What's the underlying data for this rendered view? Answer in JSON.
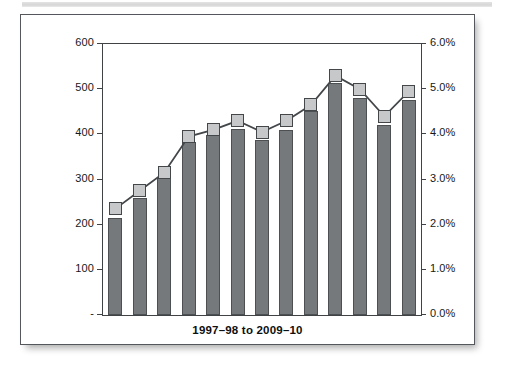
{
  "figure": {
    "frame_border_color": "#54585c",
    "background": "#ffffff"
  },
  "axes": {
    "left": {
      "ticks": [
        "600",
        "500",
        "400",
        "300",
        "200",
        "100",
        "-"
      ],
      "min": 0,
      "max": 600
    },
    "right": {
      "ticks": [
        "6.0%",
        "5.0%",
        "4.0%",
        "3.0%",
        "2.0%",
        "1.0%",
        "0.0%"
      ],
      "min": 0,
      "max": 6
    },
    "x_title": "1997–98 to 2009–10"
  },
  "chart_data": {
    "type": "bar",
    "title": "",
    "subtitle": "",
    "xlabel": "1997–98 to 2009–10",
    "ylabel": "",
    "y2label": "",
    "grid": false,
    "legend": "none",
    "categories": [
      "1997–98",
      "1998–99",
      "1999–00",
      "2000–01",
      "2001–02",
      "2002–03",
      "2003–04",
      "2004–05",
      "2005–06",
      "2006–07",
      "2007–08",
      "2008–09",
      "2009–10"
    ],
    "ylim": [
      0,
      600
    ],
    "y2lim": [
      0,
      6
    ],
    "yticks": [
      0,
      100,
      200,
      300,
      400,
      500,
      600
    ],
    "y2ticks": [
      0,
      1,
      2,
      3,
      4,
      5,
      6
    ],
    "series": [
      {
        "name": "Count",
        "type": "bar",
        "axis": "left",
        "color": "#76797c",
        "values": [
          215,
          258,
          305,
          382,
          398,
          412,
          388,
          410,
          452,
          513,
          480,
          420,
          475
        ]
      },
      {
        "name": "Percentage",
        "type": "line",
        "axis": "right",
        "color": "#43474a",
        "marker": "square",
        "marker_color": "#c6c8c9",
        "values": [
          2.35,
          2.75,
          3.15,
          3.95,
          4.1,
          4.3,
          4.05,
          4.3,
          4.65,
          5.3,
          5.0,
          4.4,
          4.95
        ]
      }
    ]
  }
}
